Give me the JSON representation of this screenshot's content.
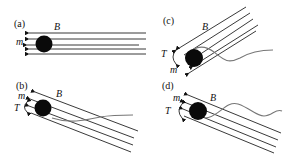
{
  "figure": {
    "panels": [
      {
        "id": "a",
        "label": "(a)",
        "field_label": "B",
        "moment_label": "m",
        "torque_label": null,
        "tail": "none",
        "field_orientation": "horizontal"
      },
      {
        "id": "b",
        "label": "(b)",
        "field_label": "B",
        "moment_label": "m",
        "torque_label": "T",
        "tail": "straight-diagonal",
        "field_orientation": "tilted-down-right"
      },
      {
        "id": "c",
        "label": "(c)",
        "field_label": "B",
        "moment_label": "m",
        "torque_label": "T",
        "tail": "wavy",
        "field_orientation": "tilted-up-right"
      },
      {
        "id": "d",
        "label": "(d)",
        "field_label": "B",
        "moment_label": "m",
        "torque_label": "T",
        "tail": "wavy",
        "field_orientation": "tilted-down-right"
      }
    ]
  },
  "colors": {
    "ball": "#0a0a0a",
    "field_lines": "#222222",
    "tail": "#777777",
    "background": "#ffffff"
  }
}
